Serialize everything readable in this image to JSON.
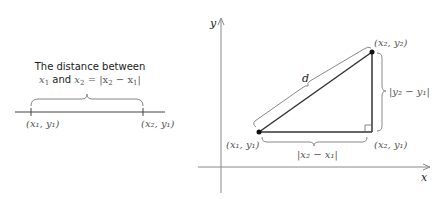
{
  "left_diagram": {
    "caption_line1": "The distance between",
    "caption_line2_prefix": "x",
    "caption_line2_sub1": "1",
    "caption_line2_and": " and ",
    "caption_line2_x2": "x",
    "caption_line2_sub2": "2",
    "caption_line2_eq": " = |x",
    "caption_line2_sub3": "2",
    "caption_line2_minus": " − x",
    "caption_line2_sub4": "1",
    "caption_line2_close": "|",
    "point1_label": "(x₁, y₁)",
    "point2_label": "(x₂, y₁)"
  },
  "right_diagram": {
    "y_axis_label": "y",
    "x_axis_label": "x",
    "hypotenuse_label": "d",
    "point1_label": "(x₁, y₁)",
    "point2_label": "(x₂, y₂)",
    "corner_label": "(x₂, y₁)",
    "horizontal_distance_label": "|x₂ − x₁|",
    "vertical_distance_label": "|y₂ − y₁|"
  },
  "colors": {
    "line": "#333333",
    "axis": "#888888",
    "brace": "#777777",
    "label": "#555555"
  }
}
